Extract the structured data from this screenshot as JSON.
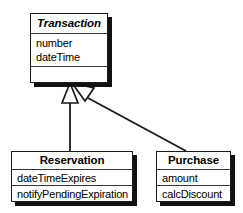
{
  "diagram": {
    "kind": "uml-class-diagram",
    "colors": {
      "background": "#ffffff",
      "line": "#1a1a1a",
      "shadow": "#111111",
      "text": "#000000"
    },
    "classes": [
      {
        "id": "transaction",
        "name": "Transaction",
        "abstract": true,
        "attributes": [
          "number",
          "dateTime"
        ],
        "operations": []
      },
      {
        "id": "reservation",
        "name": "Reservation",
        "abstract": false,
        "attributes": [
          "dateTimeExpires"
        ],
        "operations": [
          "notifyPendingExpiration"
        ]
      },
      {
        "id": "purchase",
        "name": "Purchase",
        "abstract": false,
        "attributes": [
          "amount"
        ],
        "operations": [
          "calcDiscount"
        ]
      }
    ],
    "relationships": [
      {
        "id": "gen-reservation",
        "type": "generalization",
        "from": "reservation",
        "to": "transaction",
        "arrow": "hollow-triangle"
      },
      {
        "id": "gen-purchase",
        "type": "generalization",
        "from": "purchase",
        "to": "transaction",
        "arrow": "hollow-triangle"
      }
    ]
  }
}
